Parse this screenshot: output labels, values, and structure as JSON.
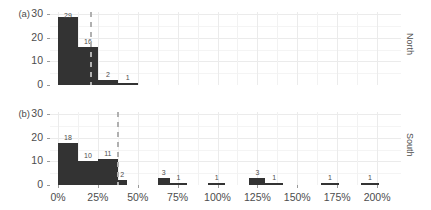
{
  "chart_data": {
    "type": "bar",
    "title": "",
    "subtitle": "",
    "xlabel": "",
    "ylabel": "",
    "xlim": [
      -5,
      215
    ],
    "ylim": [
      0,
      31
    ],
    "grid": true,
    "legend": false,
    "x_tick_labels": [
      "0%",
      "25%",
      "50%",
      "75%",
      "100%",
      "125%",
      "150%",
      "175%",
      "200%"
    ],
    "x_tick_values": [
      0,
      25,
      50,
      75,
      100,
      125,
      150,
      175,
      200
    ],
    "y_tick_labels": [
      "0",
      "10",
      "20",
      "30"
    ],
    "y_tick_values": [
      0,
      10,
      20,
      30
    ],
    "panels": [
      {
        "tag": "(a)",
        "strip_label": "North",
        "reference_line": 20,
        "bars": [
          {
            "x0": 0,
            "x1": 12.5,
            "value": 29,
            "label": "29"
          },
          {
            "x0": 12.5,
            "x1": 25,
            "value": 16,
            "label": "16"
          },
          {
            "x0": 25,
            "x1": 37.5,
            "value": 2,
            "label": "2"
          },
          {
            "x0": 37.5,
            "x1": 50,
            "value": 1,
            "label": "1"
          }
        ]
      },
      {
        "tag": "(b)",
        "strip_label": "South",
        "reference_line": 37,
        "bars": [
          {
            "x0": 0,
            "x1": 12.5,
            "value": 18,
            "label": "18"
          },
          {
            "x0": 12.5,
            "x1": 25,
            "value": 10,
            "label": "10"
          },
          {
            "x0": 25,
            "x1": 37.5,
            "value": 11,
            "label": "11"
          },
          {
            "x0": 37.5,
            "x1": 43,
            "value": 2,
            "label": "2"
          },
          {
            "x0": 62.5,
            "x1": 70,
            "value": 3,
            "label": "3"
          },
          {
            "x0": 70,
            "x1": 81,
            "value": 1,
            "label": "1"
          },
          {
            "x0": 94,
            "x1": 105,
            "value": 1,
            "label": "1"
          },
          {
            "x0": 120,
            "x1": 130,
            "value": 3,
            "label": "3"
          },
          {
            "x0": 130,
            "x1": 141,
            "value": 1,
            "label": "1"
          },
          {
            "x0": 165,
            "x1": 176,
            "value": 1,
            "label": "1"
          },
          {
            "x0": 190,
            "x1": 201,
            "value": 1,
            "label": "1"
          }
        ]
      }
    ]
  }
}
